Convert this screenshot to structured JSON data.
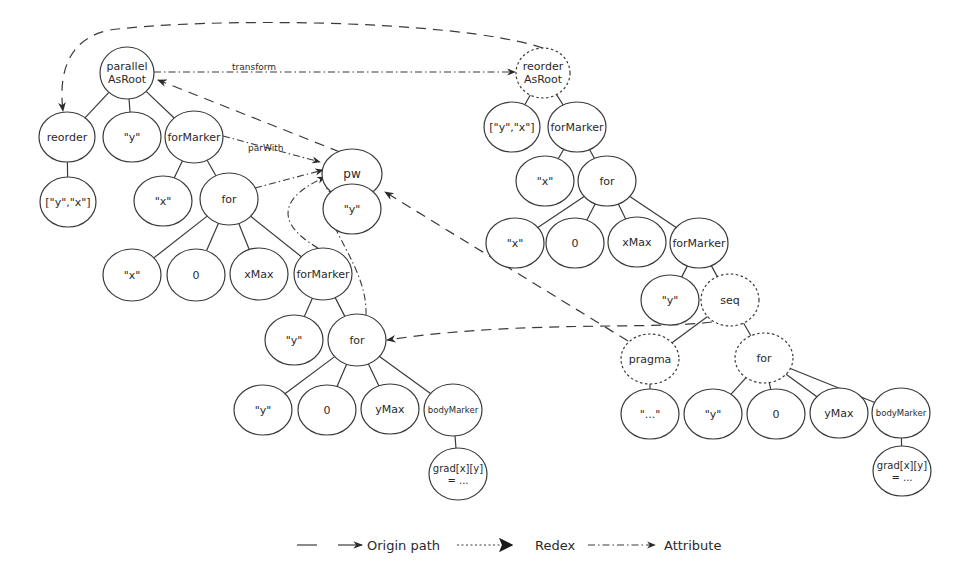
{
  "diagram": {
    "left_tree": {
      "nodes": [
        {
          "id": "L_parallel",
          "label": [
            "parallel",
            "AsRoot"
          ],
          "x": 127,
          "y": 73,
          "rx": 27,
          "ry": 26,
          "style": "solid",
          "fs": 11
        },
        {
          "id": "L_reorder",
          "label": [
            "reorder"
          ],
          "x": 67,
          "y": 137,
          "rx": 28,
          "ry": 25,
          "style": "solid",
          "fs": 11
        },
        {
          "id": "L_y1",
          "label": [
            "\"y\""
          ],
          "x": 132,
          "y": 137,
          "rx": 29,
          "ry": 25,
          "style": "solid",
          "fs": 11
        },
        {
          "id": "L_forMarker1",
          "label": [
            "forMarker"
          ],
          "x": 194,
          "y": 137,
          "rx": 29,
          "ry": 26,
          "style": "solid",
          "fs": 11
        },
        {
          "id": "L_yx",
          "label": [
            "[\"y\",\"x\"]"
          ],
          "x": 68,
          "y": 202,
          "rx": 28,
          "ry": 25,
          "style": "solid",
          "fs": 11
        },
        {
          "id": "L_x1",
          "label": [
            "\"x\""
          ],
          "x": 163,
          "y": 201,
          "rx": 29,
          "ry": 25,
          "style": "solid",
          "fs": 11
        },
        {
          "id": "L_for1",
          "label": [
            "for"
          ],
          "x": 229,
          "y": 199,
          "rx": 29,
          "ry": 26,
          "style": "solid",
          "fs": 11
        },
        {
          "id": "L_x2",
          "label": [
            "\"x\""
          ],
          "x": 132,
          "y": 275,
          "rx": 29,
          "ry": 26,
          "style": "solid",
          "fs": 11
        },
        {
          "id": "L_zero1",
          "label": [
            "0"
          ],
          "x": 196,
          "y": 275,
          "rx": 29,
          "ry": 26,
          "style": "solid",
          "fs": 11
        },
        {
          "id": "L_xMax",
          "label": [
            "xMax"
          ],
          "x": 259,
          "y": 274,
          "rx": 29,
          "ry": 26,
          "style": "solid",
          "fs": 11
        },
        {
          "id": "L_forMarker2",
          "label": [
            "forMarker"
          ],
          "x": 323,
          "y": 274,
          "rx": 29,
          "ry": 26,
          "style": "solid",
          "fs": 11
        },
        {
          "id": "L_y2",
          "label": [
            "\"y\""
          ],
          "x": 294,
          "y": 340,
          "rx": 29,
          "ry": 25,
          "style": "solid",
          "fs": 11
        },
        {
          "id": "L_for2",
          "label": [
            "for"
          ],
          "x": 357,
          "y": 340,
          "rx": 29,
          "ry": 26,
          "style": "solid",
          "fs": 11
        },
        {
          "id": "L_y3",
          "label": [
            "\"y\""
          ],
          "x": 263,
          "y": 410,
          "rx": 29,
          "ry": 25,
          "style": "solid",
          "fs": 11
        },
        {
          "id": "L_zero2",
          "label": [
            "0"
          ],
          "x": 327,
          "y": 410,
          "rx": 29,
          "ry": 25,
          "style": "solid",
          "fs": 11
        },
        {
          "id": "L_yMax",
          "label": [
            "yMax"
          ],
          "x": 390,
          "y": 409,
          "rx": 29,
          "ry": 25,
          "style": "solid",
          "fs": 11
        },
        {
          "id": "L_bodyMarker",
          "label": [
            "bodyMarker"
          ],
          "x": 453,
          "y": 410,
          "rx": 29,
          "ry": 26,
          "style": "solid",
          "fs": 8.5
        },
        {
          "id": "L_grad",
          "label": [
            "grad[x][y]",
            "= ..."
          ],
          "x": 458,
          "y": 474,
          "rx": 29,
          "ry": 26,
          "style": "solid",
          "fs": 10
        }
      ],
      "edges": [
        [
          "L_parallel",
          "L_reorder"
        ],
        [
          "L_parallel",
          "L_y1"
        ],
        [
          "L_parallel",
          "L_forMarker1"
        ],
        [
          "L_reorder",
          "L_yx"
        ],
        [
          "L_forMarker1",
          "L_x1"
        ],
        [
          "L_forMarker1",
          "L_for1"
        ],
        [
          "L_for1",
          "L_x2"
        ],
        [
          "L_for1",
          "L_zero1"
        ],
        [
          "L_for1",
          "L_xMax"
        ],
        [
          "L_for1",
          "L_forMarker2"
        ],
        [
          "L_forMarker2",
          "L_y2"
        ],
        [
          "L_forMarker2",
          "L_for2"
        ],
        [
          "L_for2",
          "L_y3"
        ],
        [
          "L_for2",
          "L_zero2"
        ],
        [
          "L_for2",
          "L_yMax"
        ],
        [
          "L_for2",
          "L_bodyMarker"
        ],
        [
          "L_bodyMarker",
          "L_grad"
        ]
      ]
    },
    "pw_tree": {
      "nodes": [
        {
          "id": "P_pw",
          "label": [
            "pw"
          ],
          "x": 352,
          "y": 174,
          "rx": 30,
          "ry": 25,
          "style": "solid",
          "fs": 12
        },
        {
          "id": "P_y",
          "label": [
            "\"y\""
          ],
          "x": 352,
          "y": 209,
          "rx": 29,
          "ry": 25,
          "style": "solid",
          "fs": 11
        }
      ],
      "edges": [
        [
          "P_pw",
          "P_y"
        ]
      ]
    },
    "right_tree": {
      "nodes": [
        {
          "id": "R_reorder",
          "label": [
            "reorder",
            "AsRoot"
          ],
          "x": 543,
          "y": 73,
          "rx": 27,
          "ry": 25,
          "style": "dotted",
          "fs": 11
        },
        {
          "id": "R_yx",
          "label": [
            "[\"y\",\"x\"]"
          ],
          "x": 512,
          "y": 127,
          "rx": 28,
          "ry": 25,
          "style": "solid",
          "fs": 11
        },
        {
          "id": "R_forMarker1",
          "label": [
            "forMarker"
          ],
          "x": 577,
          "y": 127,
          "rx": 29,
          "ry": 25,
          "style": "solid",
          "fs": 11
        },
        {
          "id": "R_x1",
          "label": [
            "\"x\""
          ],
          "x": 545,
          "y": 181,
          "rx": 29,
          "ry": 25,
          "style": "solid",
          "fs": 11
        },
        {
          "id": "R_for1",
          "label": [
            "for"
          ],
          "x": 607,
          "y": 181,
          "rx": 29,
          "ry": 25,
          "style": "solid",
          "fs": 11
        },
        {
          "id": "R_x2",
          "label": [
            "\"x\""
          ],
          "x": 515,
          "y": 243,
          "rx": 29,
          "ry": 25,
          "style": "solid",
          "fs": 11
        },
        {
          "id": "R_zero1",
          "label": [
            "0"
          ],
          "x": 575,
          "y": 243,
          "rx": 29,
          "ry": 25,
          "style": "solid",
          "fs": 11
        },
        {
          "id": "R_xMax",
          "label": [
            "xMax"
          ],
          "x": 637,
          "y": 242,
          "rx": 29,
          "ry": 25,
          "style": "solid",
          "fs": 11
        },
        {
          "id": "R_forMarker2",
          "label": [
            "forMarker"
          ],
          "x": 699,
          "y": 243,
          "rx": 29,
          "ry": 25,
          "style": "solid",
          "fs": 11
        },
        {
          "id": "R_y2",
          "label": [
            "\"y\""
          ],
          "x": 670,
          "y": 300,
          "rx": 29,
          "ry": 25,
          "style": "solid",
          "fs": 11
        },
        {
          "id": "R_seq",
          "label": [
            "seq"
          ],
          "x": 730,
          "y": 300,
          "rx": 29,
          "ry": 26,
          "style": "dotted",
          "fs": 11
        },
        {
          "id": "R_pragma",
          "label": [
            "pragma"
          ],
          "x": 650,
          "y": 359,
          "rx": 29,
          "ry": 25,
          "style": "dotted",
          "fs": 11
        },
        {
          "id": "R_for2",
          "label": [
            "for"
          ],
          "x": 764,
          "y": 358,
          "rx": 29,
          "ry": 25,
          "style": "dotted",
          "fs": 11
        },
        {
          "id": "R_dots",
          "label": [
            "\"...\""
          ],
          "x": 650,
          "y": 414,
          "rx": 29,
          "ry": 25,
          "style": "solid",
          "fs": 11
        },
        {
          "id": "R_y3",
          "label": [
            "\"y\""
          ],
          "x": 713,
          "y": 414,
          "rx": 29,
          "ry": 25,
          "style": "solid",
          "fs": 11
        },
        {
          "id": "R_zero2",
          "label": [
            "0"
          ],
          "x": 776,
          "y": 414,
          "rx": 29,
          "ry": 25,
          "style": "solid",
          "fs": 11
        },
        {
          "id": "R_yMax",
          "label": [
            "yMax"
          ],
          "x": 839,
          "y": 413,
          "rx": 29,
          "ry": 25,
          "style": "solid",
          "fs": 11
        },
        {
          "id": "R_bodyMarker",
          "label": [
            "bodyMarker"
          ],
          "x": 901,
          "y": 413,
          "rx": 29,
          "ry": 25,
          "style": "solid",
          "fs": 8.5
        },
        {
          "id": "R_grad",
          "label": [
            "grad[x][y]",
            "= ..."
          ],
          "x": 902,
          "y": 471,
          "rx": 29,
          "ry": 25,
          "style": "solid",
          "fs": 10
        }
      ],
      "edges": [
        [
          "R_reorder",
          "R_yx"
        ],
        [
          "R_reorder",
          "R_forMarker1"
        ],
        [
          "R_forMarker1",
          "R_x1"
        ],
        [
          "R_forMarker1",
          "R_for1"
        ],
        [
          "R_for1",
          "R_x2"
        ],
        [
          "R_for1",
          "R_zero1"
        ],
        [
          "R_for1",
          "R_xMax"
        ],
        [
          "R_for1",
          "R_forMarker2"
        ],
        [
          "R_forMarker2",
          "R_y2"
        ],
        [
          "R_forMarker2",
          "R_seq"
        ],
        [
          "R_seq",
          "R_pragma"
        ],
        [
          "R_seq",
          "R_for2"
        ],
        [
          "R_pragma",
          "R_dots"
        ],
        [
          "R_for2",
          "R_y3"
        ],
        [
          "R_for2",
          "R_zero2"
        ],
        [
          "R_for2",
          "R_yMax"
        ],
        [
          "R_for2",
          "R_bodyMarker"
        ],
        [
          "R_bodyMarker",
          "R_grad"
        ]
      ]
    },
    "annotations": [
      {
        "id": "transform",
        "type": "attribute",
        "label": "transform",
        "label_x": 232,
        "label_y": 70
      },
      {
        "id": "parWith",
        "type": "attribute",
        "label": "parWith",
        "label_x": 248,
        "label_y": 151
      }
    ]
  },
  "legend": {
    "items": [
      {
        "label": "",
        "type": "tree-edge"
      },
      {
        "label": "Origin path",
        "type": "origin"
      },
      {
        "label": "Redex",
        "type": "redex"
      },
      {
        "label": "Attribute",
        "type": "attribute"
      }
    ]
  }
}
